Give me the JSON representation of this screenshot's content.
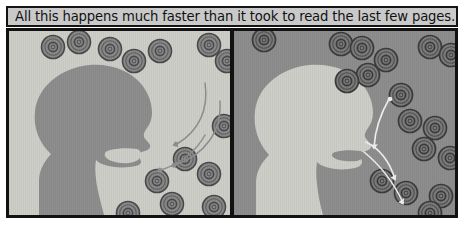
{
  "comic": {
    "caption": "All this happens much faster than it took to read the last few pages.",
    "panel_count": 2,
    "panels": [
      {
        "id": "panel-left",
        "name": "inhale-panel",
        "background_color": "#cfcfc9",
        "silhouette_color": "#8e8e8e",
        "silhouette_description": "head-profile-facing-right-mouth-open",
        "arrow_color": "#8c8c8c",
        "arrow_count": 3,
        "arrow_direction": "inward-toward-mouth",
        "particle_count": 13,
        "particle_fill": "#8a8a8a",
        "particle_stroke": "#474747",
        "particle_description": "virus-particles"
      },
      {
        "id": "panel-right",
        "name": "exhale-panel",
        "background_color": "#8e8e8e",
        "silhouette_color": "#cfcfc9",
        "silhouette_description": "head-profile-facing-right-mouth-closed",
        "arrow_color": "#f2f2f2",
        "arrow_count": 3,
        "arrow_direction": "outward-away-from-mouth",
        "particle_count": 13,
        "particle_fill": "#7a7a7a",
        "particle_stroke": "#3a3a3a",
        "particle_description": "virus-particles"
      }
    ],
    "border_color": "#121212",
    "caption_background": "#c9c9c9",
    "page_background": "#ffffff"
  }
}
